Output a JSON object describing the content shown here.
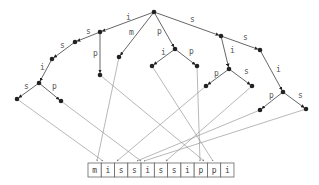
{
  "diagram": {
    "string": [
      "m",
      "i",
      "s",
      "s",
      "i",
      "s",
      "s",
      "i",
      "p",
      "p",
      "i"
    ],
    "string_box": {
      "x": 88,
      "y": 163,
      "cell_w": 13.27,
      "cell_h": 14
    },
    "nodes": [
      {
        "id": "root",
        "x": 154,
        "y": 12
      },
      {
        "id": "i",
        "x": 100,
        "y": 32
      },
      {
        "id": "is",
        "x": 75,
        "y": 42
      },
      {
        "id": "iss",
        "x": 52,
        "y": 59
      },
      {
        "id": "issi",
        "x": 39,
        "y": 83
      },
      {
        "id": "issis",
        "x": 17,
        "y": 99
      },
      {
        "id": "issip",
        "x": 61,
        "y": 101
      },
      {
        "id": "ip",
        "x": 100,
        "y": 75
      },
      {
        "id": "m",
        "x": 119,
        "y": 57
      },
      {
        "id": "p",
        "x": 175,
        "y": 49
      },
      {
        "id": "pi",
        "x": 152,
        "y": 66
      },
      {
        "id": "pp",
        "x": 197,
        "y": 66
      },
      {
        "id": "s",
        "x": 221,
        "y": 36
      },
      {
        "id": "ss",
        "x": 260,
        "y": 50
      },
      {
        "id": "ssi",
        "x": 283,
        "y": 92
      },
      {
        "id": "ssip",
        "x": 260,
        "y": 110
      },
      {
        "id": "ssis",
        "x": 306,
        "y": 109
      },
      {
        "id": "si",
        "x": 229,
        "y": 69
      },
      {
        "id": "sip",
        "x": 206,
        "y": 86
      },
      {
        "id": "sis",
        "x": 252,
        "y": 86
      }
    ],
    "edges": [
      {
        "from": "root",
        "to": "i",
        "label": "i",
        "lx": 126,
        "ly": 20
      },
      {
        "from": "i",
        "to": "is",
        "label": "s",
        "lx": 86,
        "ly": 34
      },
      {
        "from": "is",
        "to": "iss",
        "label": "s",
        "lx": 60,
        "ly": 48
      },
      {
        "from": "iss",
        "to": "issi",
        "label": "i",
        "lx": 40,
        "ly": 70
      },
      {
        "from": "issi",
        "to": "issis",
        "label": "s",
        "lx": 24,
        "ly": 89
      },
      {
        "from": "issi",
        "to": "issip",
        "label": "p",
        "lx": 52,
        "ly": 89
      },
      {
        "from": "i",
        "to": "ip",
        "label": "p",
        "lx": 93,
        "ly": 56
      },
      {
        "from": "root",
        "to": "m",
        "label": "m",
        "lx": 129,
        "ly": 35
      },
      {
        "from": "root",
        "to": "p",
        "label": "p",
        "lx": 157,
        "ly": 34
      },
      {
        "from": "p",
        "to": "pi",
        "label": "i",
        "lx": 161,
        "ly": 55
      },
      {
        "from": "p",
        "to": "pp",
        "label": "p",
        "lx": 189,
        "ly": 54
      },
      {
        "from": "root",
        "to": "s",
        "label": "s",
        "lx": 190,
        "ly": 22
      },
      {
        "from": "s",
        "to": "ss",
        "label": "s",
        "lx": 243,
        "ly": 40
      },
      {
        "from": "ss",
        "to": "ssi",
        "label": "i",
        "lx": 276,
        "ly": 72
      },
      {
        "from": "ssi",
        "to": "ssip",
        "label": "p",
        "lx": 269,
        "ly": 98
      },
      {
        "from": "ssi",
        "to": "ssis",
        "label": "s",
        "lx": 298,
        "ly": 98
      },
      {
        "from": "s",
        "to": "si",
        "label": "i",
        "lx": 230,
        "ly": 53
      },
      {
        "from": "si",
        "to": "sip",
        "label": "p",
        "lx": 214,
        "ly": 76
      },
      {
        "from": "si",
        "to": "sis",
        "label": "s",
        "lx": 244,
        "ly": 74
      }
    ],
    "pointers": [
      {
        "from": "issis",
        "to_x": 103,
        "to_y": 161,
        "mark": "s"
      },
      {
        "from": "issip",
        "to_x": 141,
        "to_y": 161,
        "mark": "p"
      },
      {
        "from": "ip",
        "to_x": 204,
        "to_y": 161,
        "mark": "p"
      },
      {
        "from": "m",
        "to_x": 97,
        "to_y": 161,
        "mark": "p"
      },
      {
        "from": "pi",
        "to_x": 213,
        "to_y": 161,
        "mark": "s"
      },
      {
        "from": "pp",
        "to_x": 200,
        "to_y": 161,
        "mark": "p"
      },
      {
        "from": "ssip",
        "to_x": 137,
        "to_y": 161,
        "mark": "s"
      },
      {
        "from": "ssis",
        "to_x": 144,
        "to_y": 161,
        "mark": "s"
      },
      {
        "from": "sip",
        "to_x": 117,
        "to_y": 161,
        "mark": "s"
      },
      {
        "from": "sis",
        "to_x": 166,
        "to_y": 161,
        "mark": "s"
      }
    ]
  }
}
